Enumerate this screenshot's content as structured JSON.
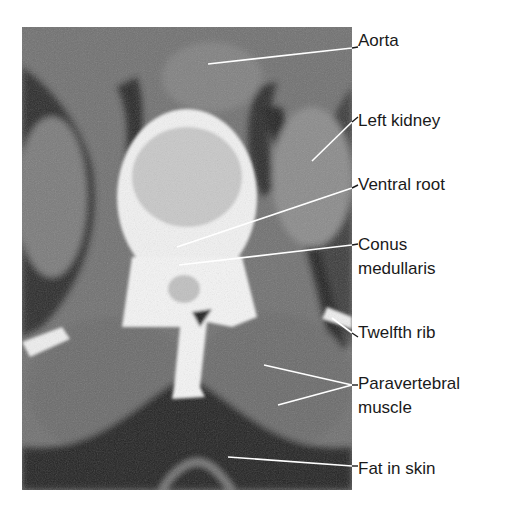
{
  "figure": {
    "type": "axial CT scan, lumbar level",
    "colors": {
      "background": "#ffffff",
      "label_text": "#1a1a1a",
      "leader_line": "#1a1a1a",
      "leader_line_on_image": "#ffffff"
    }
  },
  "labels": [
    {
      "id": "aorta",
      "text": "Aorta",
      "y": 31
    },
    {
      "id": "left-kidney",
      "text": "Left kidney",
      "y": 111
    },
    {
      "id": "ventral-root",
      "text": "Ventral root",
      "y": 175
    },
    {
      "id": "conus-medullaris-1",
      "text": "Conus",
      "y": 235
    },
    {
      "id": "conus-medullaris-2",
      "text": "medullaris",
      "y": 259
    },
    {
      "id": "twelfth-rib",
      "text": "Twelfth rib",
      "y": 323
    },
    {
      "id": "paravertebral-muscle-1",
      "text": "Paravertebral",
      "y": 374
    },
    {
      "id": "paravertebral-muscle-2",
      "text": "muscle",
      "y": 398
    },
    {
      "id": "fat-in-skin",
      "text": "Fat in skin",
      "y": 459
    }
  ]
}
